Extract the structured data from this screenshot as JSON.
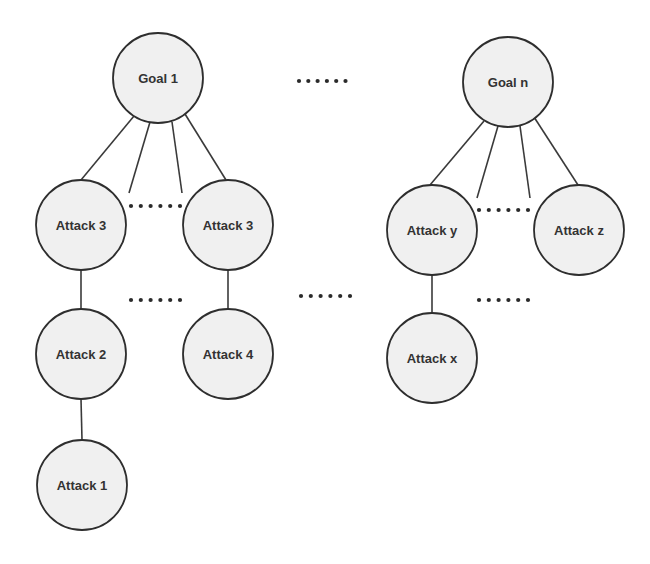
{
  "diagram": {
    "type": "attack-tree-forest",
    "colors": {
      "background": "#ffffff",
      "node_fill": "#f0f0f0",
      "node_stroke": "#2e2e2e",
      "edge": "#3a3a3a",
      "text": "#333333"
    },
    "nodes": [
      {
        "id": "goal1",
        "label": "Goal 1",
        "cx": 158,
        "cy": 78,
        "r": 45
      },
      {
        "id": "goaln",
        "label": "Goal n",
        "cx": 508,
        "cy": 82,
        "r": 45
      },
      {
        "id": "attack3a",
        "label": "Attack 3",
        "cx": 81,
        "cy": 225,
        "r": 45
      },
      {
        "id": "attack3b",
        "label": "Attack 3",
        "cx": 228,
        "cy": 225,
        "r": 45
      },
      {
        "id": "attack2",
        "label": "Attack 2",
        "cx": 81,
        "cy": 354,
        "r": 45
      },
      {
        "id": "attack4",
        "label": "Attack 4",
        "cx": 228,
        "cy": 354,
        "r": 45
      },
      {
        "id": "attack1",
        "label": "Attack 1",
        "cx": 82,
        "cy": 485,
        "r": 45
      },
      {
        "id": "attacky",
        "label": "Attack y",
        "cx": 432,
        "cy": 230,
        "r": 45
      },
      {
        "id": "attackz",
        "label": "Attack z",
        "cx": 579,
        "cy": 230,
        "r": 45
      },
      {
        "id": "attackx",
        "label": "Attack x",
        "cx": 432,
        "cy": 358,
        "r": 45
      }
    ],
    "edges": [
      {
        "from": "goal1",
        "to": "attack3a",
        "x1": 134,
        "y1": 116,
        "x2": 81,
        "y2": 180
      },
      {
        "from": "goal1",
        "to": "(elided)",
        "x1": 150,
        "y1": 122,
        "x2": 129,
        "y2": 193
      },
      {
        "from": "goal1",
        "to": "(elided)",
        "x1": 172,
        "y1": 122,
        "x2": 182,
        "y2": 193
      },
      {
        "from": "goal1",
        "to": "attack3b",
        "x1": 185,
        "y1": 114,
        "x2": 226,
        "y2": 180
      },
      {
        "from": "goaln",
        "to": "attacky",
        "x1": 484,
        "y1": 121,
        "x2": 430,
        "y2": 185
      },
      {
        "from": "goaln",
        "to": "(elided)",
        "x1": 498,
        "y1": 126,
        "x2": 477,
        "y2": 198
      },
      {
        "from": "goaln",
        "to": "(elided)",
        "x1": 520,
        "y1": 126,
        "x2": 530,
        "y2": 198
      },
      {
        "from": "goaln",
        "to": "attackz",
        "x1": 534,
        "y1": 117,
        "x2": 578,
        "y2": 185
      },
      {
        "from": "attack3a",
        "to": "attack2",
        "x1": 81,
        "y1": 270,
        "x2": 81,
        "y2": 309
      },
      {
        "from": "attack3b",
        "to": "attack4",
        "x1": 228,
        "y1": 270,
        "x2": 228,
        "y2": 309
      },
      {
        "from": "attack2",
        "to": "attack1",
        "x1": 81,
        "y1": 399,
        "x2": 82,
        "y2": 440
      },
      {
        "from": "attacky",
        "to": "attackx",
        "x1": 432,
        "y1": 275,
        "x2": 432,
        "y2": 313
      }
    ],
    "ellipses": [
      {
        "id": "between-goals",
        "text": "......",
        "x": 299,
        "y": 81,
        "count": 6,
        "spacing": 9.3
      },
      {
        "id": "between-goal1-children",
        "text": "......",
        "x": 131,
        "y": 206,
        "count": 6,
        "spacing": 9.8
      },
      {
        "id": "between-goal1-level2",
        "text": "......",
        "x": 131,
        "y": 300,
        "count": 6,
        "spacing": 9.8
      },
      {
        "id": "between-trees",
        "text": "......",
        "x": 301,
        "y": 296,
        "count": 6,
        "spacing": 9.8
      },
      {
        "id": "between-goaln-children",
        "text": "......",
        "x": 479,
        "y": 210,
        "count": 6,
        "spacing": 9.8
      },
      {
        "id": "between-goaln-level2",
        "text": "......",
        "x": 479,
        "y": 300,
        "count": 6,
        "spacing": 9.8
      }
    ]
  }
}
